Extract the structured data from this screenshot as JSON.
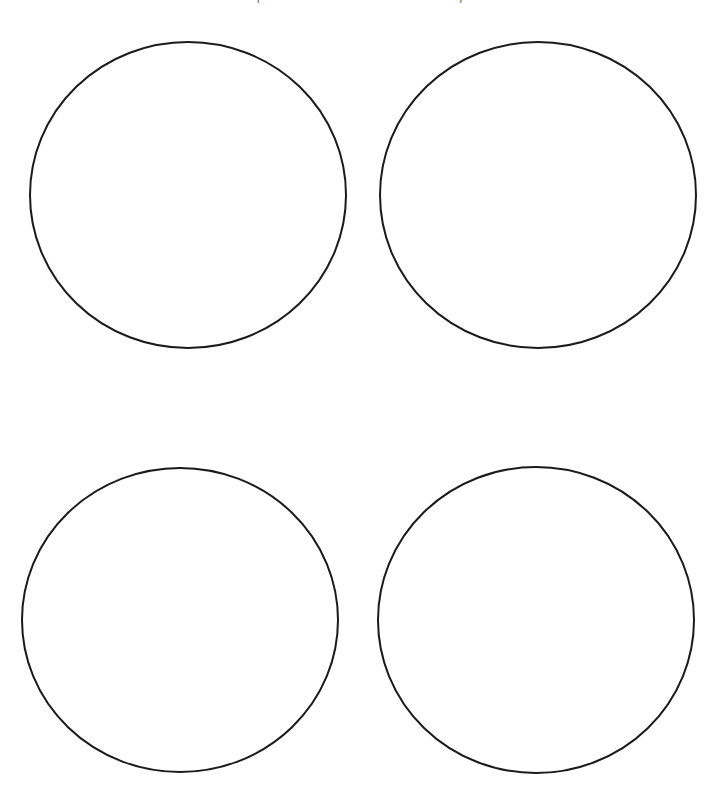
{
  "page": {
    "background": "#ffffff",
    "caption_fragment": "(                                              )"
  },
  "diagram": {
    "stroke_color": "#1a1a1a",
    "stroke_width": 2,
    "fill": "none",
    "circles": [
      {
        "id": "top-left",
        "cx": 188,
        "cy": 195,
        "rx": 158,
        "ry": 153
      },
      {
        "id": "top-right",
        "cx": 538,
        "cy": 195,
        "rx": 158,
        "ry": 153
      },
      {
        "id": "bottom-left",
        "cx": 180,
        "cy": 620,
        "rx": 158,
        "ry": 152
      },
      {
        "id": "bottom-right",
        "cx": 536,
        "cy": 620,
        "rx": 158,
        "ry": 153
      }
    ]
  }
}
